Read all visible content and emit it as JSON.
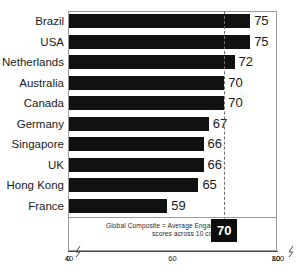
{
  "chart_data": {
    "type": "bar",
    "orientation": "horizontal",
    "title": "",
    "subtitle": "",
    "xlabel": "",
    "ylabel": "",
    "categories": [
      "Brazil",
      "USA",
      "Netherlands",
      "Australia",
      "Canada",
      "Germany",
      "Singapore",
      "UK",
      "Hong Kong",
      "France"
    ],
    "values": [
      75,
      75,
      72,
      70,
      70,
      67,
      66,
      65,
      66,
      59
    ],
    "series": [
      {
        "name": "Engagement score",
        "values": [
          75,
          75,
          72,
          70,
          70,
          67,
          66,
          66,
          65,
          59
        ]
      }
    ],
    "bars": [
      {
        "label": "Brazil",
        "value": 75,
        "value_text": "75"
      },
      {
        "label": "USA",
        "value": 75,
        "value_text": "75"
      },
      {
        "label": "Netherlands",
        "value": 72,
        "value_text": "72"
      },
      {
        "label": "Australia",
        "value": 70,
        "value_text": "70"
      },
      {
        "label": "Canada",
        "value": 70,
        "value_text": "70"
      },
      {
        "label": "Germany",
        "value": 67,
        "value_text": "67"
      },
      {
        "label": "Singapore",
        "value": 66,
        "value_text": "66"
      },
      {
        "label": "UK",
        "value": 66,
        "value_text": "66"
      },
      {
        "label": "Hong Kong",
        "value": 65,
        "value_text": "65"
      },
      {
        "label": "France",
        "value": 59,
        "value_text": "59"
      }
    ],
    "xlim": [
      40,
      80
    ],
    "x_ticks": [
      {
        "value": 0,
        "label": "0"
      },
      {
        "value": 40,
        "label": "40"
      },
      {
        "value": 60,
        "label": "60"
      },
      {
        "value": 80,
        "label": "80"
      },
      {
        "value": 100,
        "label": "100"
      }
    ],
    "axis_breaks": [
      0.5,
      99.5
    ],
    "grid": false,
    "legend": "none",
    "reference_line": {
      "value": 70,
      "label": "70",
      "style": "dashed"
    },
    "annotation": {
      "line1": "Global Composite = Average Engagement",
      "line2": "scores across 10 countries",
      "badge_value": "70"
    },
    "colors": {
      "bar": "#111111",
      "frame": "#9a9a9a",
      "reference_line": "#6e6e6e",
      "badge_bg": "#0d0d0d",
      "badge_text": "#ffffff",
      "text": "#1a1a1a",
      "background": "#ffffff"
    }
  }
}
